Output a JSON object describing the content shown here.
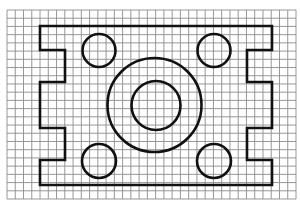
{
  "canvas": {
    "width": 300,
    "height": 204,
    "background": "#ffffff"
  },
  "grid": {
    "x0": 7,
    "y0": 10,
    "x1": 296,
    "y1": 199,
    "cols": 35,
    "rows": 23,
    "color": "#8c8c8c"
  },
  "outline": {
    "name": "plate-outline",
    "stroke": "#111111",
    "points": [
      [
        40,
        26
      ],
      [
        272,
        26
      ],
      [
        272,
        50
      ],
      [
        247,
        50
      ],
      [
        247,
        82
      ],
      [
        272,
        82
      ],
      [
        272,
        128
      ],
      [
        247,
        128
      ],
      [
        247,
        160
      ],
      [
        272,
        160
      ],
      [
        272,
        185
      ],
      [
        40,
        185
      ],
      [
        40,
        160
      ],
      [
        65,
        160
      ],
      [
        65,
        128
      ],
      [
        40,
        128
      ],
      [
        40,
        82
      ],
      [
        65,
        82
      ],
      [
        65,
        50
      ],
      [
        40,
        50
      ]
    ]
  },
  "circles": [
    {
      "name": "center-ring-outer",
      "cx": 154.5,
      "cy": 105,
      "r": 47
    },
    {
      "name": "center-ring-inner",
      "cx": 156,
      "cy": 105.5,
      "r": 24.5
    },
    {
      "name": "hole-top-left",
      "cx": 99,
      "cy": 50.5,
      "r": 16.5
    },
    {
      "name": "hole-top-right",
      "cx": 214,
      "cy": 50.5,
      "r": 16.5
    },
    {
      "name": "hole-bottom-left",
      "cx": 99,
      "cy": 161,
      "r": 17
    },
    {
      "name": "hole-bottom-right",
      "cx": 214,
      "cy": 161,
      "r": 17
    }
  ]
}
